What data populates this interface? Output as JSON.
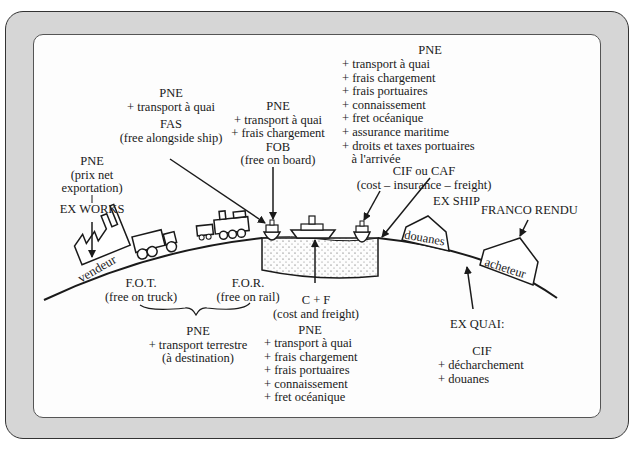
{
  "diagram": {
    "places": {
      "seller": "vendeur",
      "customs": "douanes",
      "buyer": "acheteur"
    },
    "terms": {
      "ex_works": {
        "lines": [
          "PNE",
          "(prix net",
          "exportation)"
        ],
        "code": "EX WORKS"
      },
      "fas": {
        "lines": [
          "PNE",
          "+ transport à quai"
        ],
        "code": "FAS",
        "meaning": "(free alongside ship)"
      },
      "fob": {
        "lines": [
          "PNE",
          "+ transport à quai",
          "+ frais chargement"
        ],
        "code": "FOB",
        "meaning": "(free on board)"
      },
      "cif": {
        "header": "PNE",
        "lines": [
          "+ transport à quai",
          "+ frais chargement",
          "+ frais portuaires",
          "+ connaissement",
          "+ fret océanique",
          "+ assurance maritime",
          "+ droits et taxes portuaires",
          "   à l'arrivée"
        ],
        "code": "CIF ou CAF",
        "meaning": "(cost – insurance – freight)"
      },
      "ex_ship": {
        "code": "EX SHIP"
      },
      "franco_rendu": {
        "code": "FRANCO RENDU"
      },
      "fot": {
        "code": "F.O.T.",
        "meaning": "(free on truck)"
      },
      "for": {
        "code": "F.O.R.",
        "meaning": "(free on rail)"
      },
      "land_transport": {
        "lines": [
          "PNE",
          "+ transport terrestre",
          "(à destination)"
        ]
      },
      "cf": {
        "code": "C + F",
        "meaning": "(cost and freight)",
        "header": "PNE",
        "lines": [
          "+ transport à quai",
          "+ frais chargement",
          "+ frais portuaires",
          "+ connaissement",
          "+ fret océanique"
        ]
      },
      "ex_quai": {
        "code": "EX QUAI:",
        "header": "CIF",
        "lines": [
          "+ décharchement",
          "+ douanes"
        ]
      }
    },
    "colors": {
      "frame": "#d6d6d6",
      "panel": "#fdfdfd",
      "ink": "#1a1a1a"
    }
  }
}
